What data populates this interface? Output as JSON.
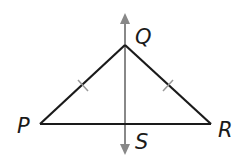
{
  "diagram": {
    "type": "geometry",
    "points": {
      "P": {
        "label": "P",
        "x": 40,
        "y": 124
      },
      "Q": {
        "label": "Q",
        "x": 125,
        "y": 45
      },
      "R": {
        "label": "R",
        "x": 211,
        "y": 124
      },
      "S": {
        "label": "S",
        "x": 125,
        "y": 124
      }
    },
    "segments": [
      {
        "from": "P",
        "to": "Q",
        "tick_marks": 1
      },
      {
        "from": "Q",
        "to": "R",
        "tick_marks": 1
      },
      {
        "from": "P",
        "to": "R",
        "tick_marks": 0
      }
    ],
    "line": {
      "through": [
        "Q",
        "S"
      ],
      "arrows": "both",
      "color": "#888888"
    },
    "colors": {
      "segment": "#1a1a1a",
      "line": "#888888",
      "tick": "#999999"
    }
  }
}
